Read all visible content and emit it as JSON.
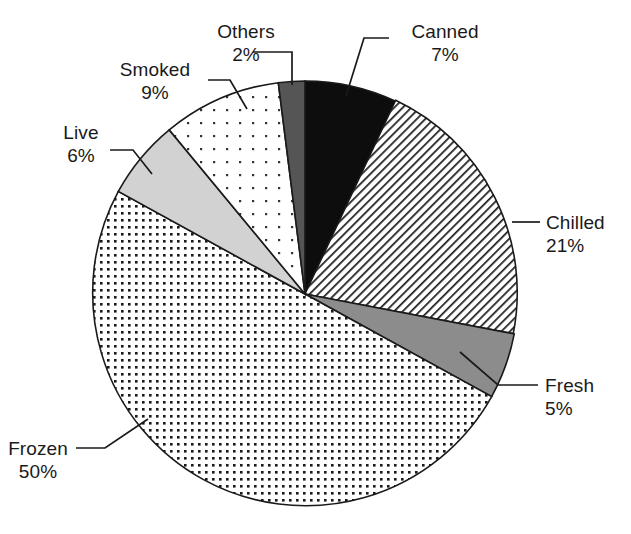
{
  "chart_data": {
    "type": "pie",
    "title": "",
    "subtitle": "",
    "xlabel": "",
    "ylabel": "",
    "legend_position": "none",
    "grid": false,
    "unit": "%",
    "categories": [
      "Canned",
      "Chilled",
      "Fresh",
      "Frozen",
      "Live",
      "Smoked",
      "Others"
    ],
    "values": [
      7,
      21,
      5,
      50,
      6,
      9,
      2
    ],
    "start_angle_deg": 0,
    "direction": "clockwise",
    "slices": [
      {
        "label": "Canned",
        "value": 7,
        "value_text": "7%",
        "fill": "solid-black",
        "color": "#0d0d0d"
      },
      {
        "label": "Chilled",
        "value": 21,
        "value_text": "21%",
        "fill": "diagonal-lines",
        "color": "#ffffff"
      },
      {
        "label": "Fresh",
        "value": 5,
        "value_text": "5%",
        "fill": "solid-gray",
        "color": "#8c8c8c"
      },
      {
        "label": "Frozen",
        "value": 50,
        "value_text": "50%",
        "fill": "dense-dots",
        "color": "#ffffff"
      },
      {
        "label": "Live",
        "value": 6,
        "value_text": "6%",
        "fill": "light-gray",
        "color": "#d2d2d2"
      },
      {
        "label": "Smoked",
        "value": 9,
        "value_text": "9%",
        "fill": "sparse-dots",
        "color": "#ffffff"
      },
      {
        "label": "Others",
        "value": 2,
        "value_text": "2%",
        "fill": "dark-gray",
        "color": "#555555"
      }
    ]
  },
  "labels": {
    "others": {
      "name": "Others",
      "percent": "2%"
    },
    "canned": {
      "name": "Canned",
      "percent": "7%"
    },
    "smoked": {
      "name": "Smoked",
      "percent": "9%"
    },
    "live": {
      "name": "Live",
      "percent": "6%"
    },
    "chilled": {
      "name": "Chilled",
      "percent": "21%"
    },
    "fresh": {
      "name": "Fresh",
      "percent": "5%"
    },
    "frozen": {
      "name": "Frozen",
      "percent": "50%"
    }
  },
  "style": {
    "outline": "#1a1a1a",
    "text": "#1a1a1a",
    "background": "#ffffff"
  }
}
